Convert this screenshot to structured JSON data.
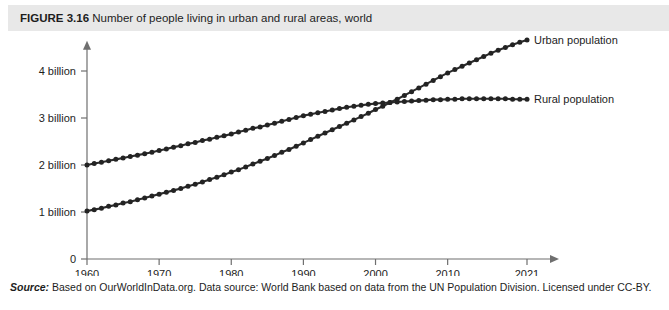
{
  "figure": {
    "label": "FIGURE 3.16",
    "caption": "Number of people living in urban and rural areas, world",
    "full_caption": "FIGURE 3.16 Number of people living in urban and rural areas, world"
  },
  "source": {
    "label": "Source:",
    "text": "Based on OurWorldInData.org. Data source: World Bank based on data from the UN Population Division. Licensed under CC-BY."
  },
  "colors": {
    "header_band": "#e8e8e8",
    "series": "#232323",
    "axis": "#6f6f6f",
    "background": "#ffffff",
    "text": "#1d1d1d"
  },
  "chart_data": {
    "type": "line",
    "title": "Number of people living in urban and rural areas, world",
    "xlabel": "",
    "ylabel": "",
    "xlim": [
      1960,
      2021
    ],
    "ylim": [
      0,
      4.6
    ],
    "grid": false,
    "legend_position": "right-of-line-ends",
    "x_tick_labels": [
      "1960",
      "1970",
      "1980",
      "1990",
      "2000",
      "2010",
      "2021"
    ],
    "x_ticks": [
      1960,
      1970,
      1980,
      1990,
      2000,
      2010,
      2021
    ],
    "y_tick_labels": [
      "0",
      "1 billion",
      "2 billion",
      "3 billion",
      "4 billion"
    ],
    "y_ticks": [
      0,
      1,
      2,
      3,
      4
    ],
    "y_unit": "billions of people",
    "marker": "circle",
    "marker_interval_years": 1,
    "x": [
      1960,
      1961,
      1962,
      1963,
      1964,
      1965,
      1966,
      1967,
      1968,
      1969,
      1970,
      1971,
      1972,
      1973,
      1974,
      1975,
      1976,
      1977,
      1978,
      1979,
      1980,
      1981,
      1982,
      1983,
      1984,
      1985,
      1986,
      1987,
      1988,
      1989,
      1990,
      1991,
      1992,
      1993,
      1994,
      1995,
      1996,
      1997,
      1998,
      1999,
      2000,
      2001,
      2002,
      2003,
      2004,
      2005,
      2006,
      2007,
      2008,
      2009,
      2010,
      2011,
      2012,
      2013,
      2014,
      2015,
      2016,
      2017,
      2018,
      2019,
      2020,
      2021
    ],
    "series": [
      {
        "name": "Urban population",
        "label": "Urban population",
        "color": "#232323",
        "values": [
          1.02,
          1.05,
          1.08,
          1.12,
          1.15,
          1.19,
          1.22,
          1.26,
          1.3,
          1.34,
          1.38,
          1.42,
          1.46,
          1.5,
          1.55,
          1.59,
          1.64,
          1.69,
          1.74,
          1.79,
          1.85,
          1.9,
          1.96,
          2.02,
          2.08,
          2.14,
          2.2,
          2.27,
          2.33,
          2.4,
          2.47,
          2.54,
          2.61,
          2.68,
          2.75,
          2.82,
          2.89,
          2.96,
          3.03,
          3.1,
          3.18,
          3.25,
          3.33,
          3.4,
          3.48,
          3.56,
          3.64,
          3.72,
          3.8,
          3.88,
          3.96,
          4.03,
          4.1,
          4.17,
          4.24,
          4.31,
          4.38,
          4.44,
          4.5,
          4.56,
          4.61,
          4.66
        ],
        "endpoint_value": 4.66,
        "start_value": 1.02
      },
      {
        "name": "Rural population",
        "label": "Rural population",
        "color": "#232323",
        "values": [
          2.0,
          2.03,
          2.06,
          2.09,
          2.12,
          2.15,
          2.18,
          2.21,
          2.24,
          2.27,
          2.31,
          2.34,
          2.38,
          2.41,
          2.45,
          2.48,
          2.52,
          2.55,
          2.59,
          2.62,
          2.66,
          2.7,
          2.74,
          2.78,
          2.81,
          2.85,
          2.89,
          2.93,
          2.97,
          3.01,
          3.05,
          3.08,
          3.11,
          3.14,
          3.17,
          3.2,
          3.23,
          3.25,
          3.27,
          3.29,
          3.31,
          3.32,
          3.33,
          3.34,
          3.35,
          3.36,
          3.37,
          3.38,
          3.39,
          3.39,
          3.4,
          3.4,
          3.41,
          3.41,
          3.41,
          3.41,
          3.41,
          3.41,
          3.41,
          3.4,
          3.4,
          3.4
        ],
        "endpoint_value": 3.4,
        "start_value": 2.0
      }
    ],
    "annotations": [
      {
        "text": "crossover of urban and rural around 2007 at about 3.35 billion",
        "year": 2007,
        "value": 3.35
      }
    ]
  }
}
